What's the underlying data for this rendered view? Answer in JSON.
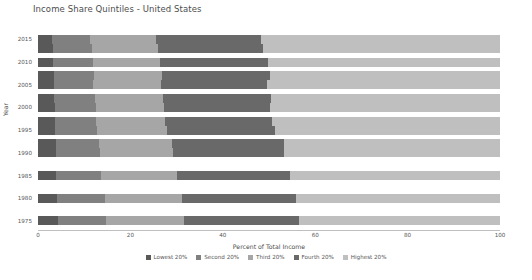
{
  "chart_data": {
    "type": "bar",
    "orientation": "horizontal",
    "stacked": true,
    "title": "Income Share Quintiles - United States",
    "xlabel": "Percent of Total Income",
    "ylabel": "Year",
    "xlim": [
      0,
      100
    ],
    "xticks": [
      "0",
      "20",
      "40",
      "60",
      "80",
      "100"
    ],
    "xtick_values": [
      0,
      20,
      40,
      60,
      80,
      100
    ],
    "yticks": [
      "2015",
      "2010",
      "2005",
      "2000",
      "1995",
      "1990",
      "1985",
      "1980",
      "1975"
    ],
    "ytick_values": [
      2015,
      2010,
      2005,
      2000,
      1995,
      1990,
      1985,
      1980,
      1975
    ],
    "grid": false,
    "legend_position": "bottom",
    "categories": [
      2015,
      2013,
      2010,
      2007,
      2005,
      2002,
      2000,
      1997,
      1995,
      1992,
      1990,
      1985,
      1980,
      1975
    ],
    "series": [
      {
        "name": "Lowest 20%",
        "color": "#595959",
        "values": [
          3.1,
          3.2,
          3.3,
          3.4,
          3.4,
          3.5,
          3.6,
          3.6,
          3.7,
          3.8,
          3.8,
          4.0,
          4.2,
          4.3
        ]
      },
      {
        "name": "Second 20%",
        "color": "#808080",
        "values": [
          8.2,
          8.4,
          8.5,
          8.7,
          8.6,
          8.8,
          8.9,
          8.9,
          9.1,
          9.4,
          9.6,
          9.7,
          10.2,
          10.4
        ]
      },
      {
        "name": "Third 20%",
        "color": "#a6a6a6",
        "values": [
          14.3,
          14.4,
          14.6,
          14.8,
          14.6,
          14.8,
          14.8,
          15.0,
          15.2,
          15.8,
          15.9,
          16.3,
          16.8,
          17.0
        ]
      },
      {
        "name": "Fourth 20%",
        "color": "#696969",
        "values": [
          22.6,
          22.7,
          23.4,
          23.4,
          23.0,
          23.3,
          23.0,
          23.2,
          23.3,
          24.2,
          24.0,
          24.6,
          24.7,
          24.7
        ]
      },
      {
        "name": "Highest 20%",
        "color": "#bfbfbf",
        "values": [
          51.8,
          51.3,
          50.2,
          49.7,
          50.4,
          49.6,
          49.7,
          49.3,
          48.7,
          46.8,
          46.7,
          45.4,
          44.1,
          43.6
        ]
      }
    ]
  },
  "legend": {
    "items": [
      {
        "label": "Lowest 20%"
      },
      {
        "label": "Second 20%"
      },
      {
        "label": "Third 20%"
      },
      {
        "label": "Fourth 20%"
      },
      {
        "label": "Highest 20%"
      }
    ]
  }
}
